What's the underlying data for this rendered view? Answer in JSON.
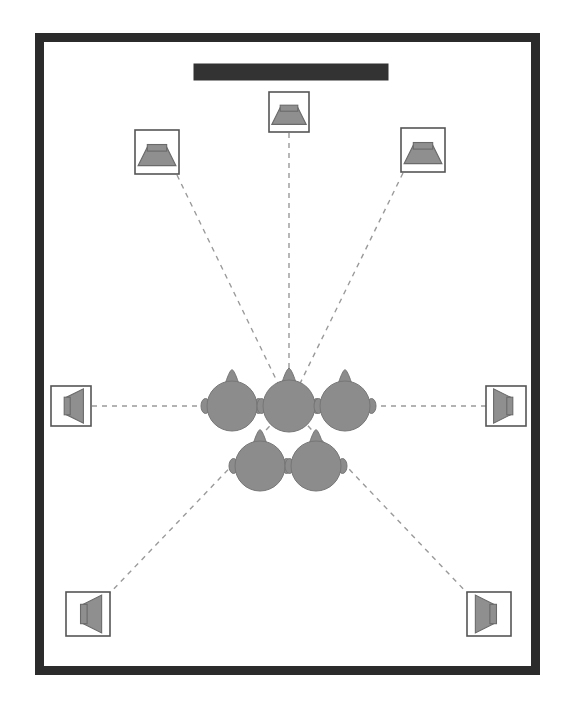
{
  "diagram": {
    "type": "floor-plan"
  },
  "colors": {
    "room_wall": "#2b2b2b",
    "room_floor": "#ffffff",
    "screen": "#333333",
    "speaker_body_fill": "#ffffff",
    "speaker_body_stroke": "#555555",
    "speaker_cone_fill": "#8f8f8f",
    "speaker_cone_stroke": "#6a6a6a",
    "head_fill": "#8c8c8c",
    "head_stroke": "#767676",
    "sight_line": "#9a9a9a"
  },
  "room": {
    "name": "listening-room",
    "wall_thickness_px": 9,
    "bounds": {
      "x": 35,
      "y": 33,
      "width": 505,
      "height": 642
    }
  },
  "screen": {
    "name": "projection-screen",
    "label": "Screen",
    "bounds": {
      "x": 194,
      "y": 64,
      "width": 194,
      "height": 16
    }
  },
  "sweet_spot": {
    "name": "primary-listening-position",
    "label": "Sweet Spot",
    "x": 289,
    "y": 406
  },
  "speakers": [
    {
      "id": "center",
      "label": "Center",
      "channel": "C",
      "x": 289,
      "y": 112,
      "size": 40,
      "rotation_deg": 0,
      "aim_deg": 180
    },
    {
      "id": "front-left",
      "label": "Front Left",
      "channel": "FL",
      "x": 157,
      "y": 152,
      "size": 44,
      "rotation_deg": 28,
      "aim_deg": 152
    },
    {
      "id": "front-right",
      "label": "Front Right",
      "channel": "FR",
      "x": 423,
      "y": 150,
      "size": 44,
      "rotation_deg": -28,
      "aim_deg": 208
    },
    {
      "id": "surround-left",
      "label": "Surround Left",
      "channel": "SL",
      "x": 71,
      "y": 406,
      "size": 40,
      "rotation_deg": 0,
      "aim_deg": 90
    },
    {
      "id": "surround-right",
      "label": "Surround Right",
      "channel": "SR",
      "x": 506,
      "y": 406,
      "size": 40,
      "rotation_deg": 0,
      "aim_deg": 270
    },
    {
      "id": "surround-back-left",
      "label": "Surround Back Left",
      "channel": "SBL",
      "x": 88,
      "y": 614,
      "size": 44,
      "rotation_deg": 45,
      "aim_deg": 45
    },
    {
      "id": "surround-back-right",
      "label": "Surround Back Right",
      "channel": "SBR",
      "x": 489,
      "y": 614,
      "size": 44,
      "rotation_deg": -45,
      "aim_deg": 315
    }
  ],
  "listeners": [
    {
      "id": "seat-front-left",
      "label": "Listener Front Left",
      "x": 232,
      "y": 406,
      "radius": 25,
      "facing_deg": 0,
      "primary": false
    },
    {
      "id": "seat-front-center",
      "label": "Listener Sweet Spot",
      "x": 289,
      "y": 406,
      "radius": 26,
      "facing_deg": 0,
      "primary": true
    },
    {
      "id": "seat-front-right",
      "label": "Listener Front Right",
      "x": 345,
      "y": 406,
      "radius": 25,
      "facing_deg": 0,
      "primary": false
    },
    {
      "id": "seat-back-left",
      "label": "Listener Back Left",
      "x": 260,
      "y": 466,
      "radius": 25,
      "facing_deg": 0,
      "primary": false
    },
    {
      "id": "seat-back-right",
      "label": "Listener Back Right",
      "x": 316,
      "y": 466,
      "radius": 25,
      "facing_deg": 0,
      "primary": false
    }
  ],
  "sight_lines": [
    {
      "id": "line-center",
      "label": "Center axis",
      "from_speaker": "center",
      "x1": 289,
      "y1": 133,
      "x2": 289,
      "y2": 406
    },
    {
      "id": "line-front-left",
      "label": "Front left axis",
      "from_speaker": "front-left",
      "x1": 177,
      "y1": 175,
      "x2": 289,
      "y2": 406
    },
    {
      "id": "line-front-right",
      "label": "Front right axis",
      "from_speaker": "front-right",
      "x1": 403,
      "y1": 173,
      "x2": 289,
      "y2": 406
    },
    {
      "id": "line-surround-left",
      "label": "Surround left axis",
      "from_speaker": "surround-left",
      "x1": 92,
      "y1": 406,
      "x2": 289,
      "y2": 406
    },
    {
      "id": "line-surround-right",
      "label": "Surround right axis",
      "from_speaker": "surround-right",
      "x1": 486,
      "y1": 406,
      "x2": 289,
      "y2": 406
    },
    {
      "id": "line-surround-back-left",
      "label": "Surround back left axis",
      "from_speaker": "surround-back-left",
      "x1": 107,
      "y1": 596,
      "x2": 289,
      "y2": 406
    },
    {
      "id": "line-surround-back-right",
      "label": "Surround back right axis",
      "from_speaker": "surround-back-right",
      "x1": 470,
      "y1": 596,
      "x2": 289,
      "y2": 406
    }
  ]
}
